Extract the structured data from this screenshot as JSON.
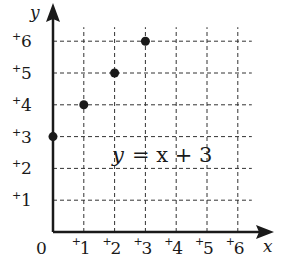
{
  "chart_data": {
    "type": "scatter",
    "title": "",
    "annotation": "y = x + 3",
    "xlabel": "x",
    "ylabel": "y",
    "xlim": [
      0,
      6
    ],
    "ylim": [
      0,
      6
    ],
    "grid": true,
    "grid_style": "dashed",
    "origin_label": "0",
    "x_ticks": [
      "+1",
      "+2",
      "+3",
      "+4",
      "+5",
      "+6"
    ],
    "y_ticks": [
      "+1",
      "+2",
      "+3",
      "+4",
      "+5",
      "+6"
    ],
    "series": [
      {
        "name": "y = x + 3",
        "x": [
          0,
          1,
          2,
          3
        ],
        "y": [
          3,
          4,
          5,
          6
        ]
      }
    ]
  },
  "labels": {
    "origin": "0",
    "x_axis": "x",
    "y_axis": "y",
    "equation_y": "y",
    "equation_rest": "= x + 3",
    "x_ticks": [
      "1",
      "2",
      "3",
      "4",
      "5",
      "6"
    ],
    "y_ticks": [
      "1",
      "2",
      "3",
      "4",
      "5",
      "6"
    ],
    "sign": "+"
  },
  "colors": {
    "ink": "#1a1a1a",
    "grid": "#333333",
    "background": "#ffffff"
  }
}
